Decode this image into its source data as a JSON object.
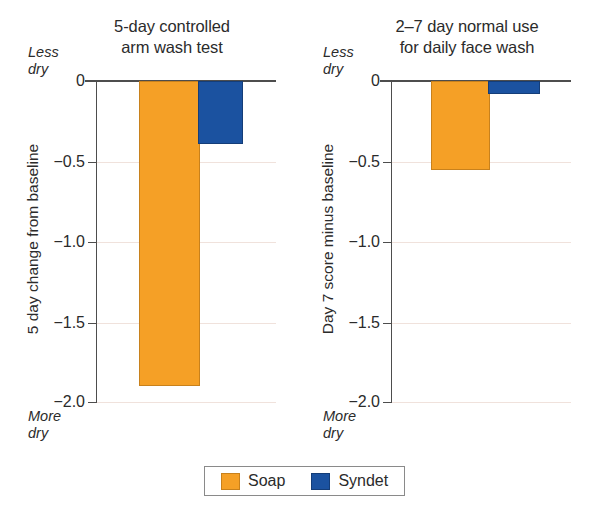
{
  "chart_data": [
    {
      "type": "bar",
      "title": "5-day controlled arm wash test",
      "title_lines": [
        "5-day controlled",
        "arm wash test"
      ],
      "xlabel": "",
      "ylabel": "5 day change from baseline",
      "ylim": [
        -2.0,
        0
      ],
      "yticks": [
        0,
        -0.5,
        -1.0,
        -1.5,
        -2.0
      ],
      "ytick_labels": [
        "0",
        "−0.5",
        "−1.0",
        "−1.5",
        "−2.0"
      ],
      "grid": true,
      "categories": [
        ""
      ],
      "series": [
        {
          "name": "Soap",
          "values": [
            -1.88
          ],
          "color": "#f5a026"
        },
        {
          "name": "Syndet",
          "values": [
            -0.38
          ],
          "color": "#1b52a0"
        }
      ],
      "annotations": {
        "axis_top": "Less dry",
        "axis_top_lines": [
          "Less",
          "dry"
        ],
        "axis_bottom": "More dry",
        "axis_bottom_lines": [
          "More",
          "dry"
        ]
      }
    },
    {
      "type": "bar",
      "title": "2–7 day normal use for daily face wash",
      "title_lines": [
        "2–7 day normal use",
        "for daily face wash"
      ],
      "xlabel": "",
      "ylabel": "Day 7 score minus baseline",
      "ylim": [
        -2.0,
        0
      ],
      "yticks": [
        0,
        -0.5,
        -1.0,
        -1.5,
        -2.0
      ],
      "ytick_labels": [
        "0",
        "−0.5",
        "−1.0",
        "−1.5",
        "−2.0"
      ],
      "grid": true,
      "categories": [
        ""
      ],
      "series": [
        {
          "name": "Soap",
          "values": [
            -0.54
          ],
          "color": "#f5a026"
        },
        {
          "name": "Syndet",
          "values": [
            -0.07
          ],
          "color": "#1b52a0"
        }
      ],
      "annotations": {
        "axis_top": "Less dry",
        "axis_top_lines": [
          "Less",
          "dry"
        ],
        "axis_bottom": "More dry",
        "axis_bottom_lines": [
          "More",
          "dry"
        ]
      }
    }
  ],
  "legend": {
    "position": "bottom-center",
    "entries": [
      {
        "label": "Soap",
        "color": "#f5a026"
      },
      {
        "label": "Syndet",
        "color": "#1b52a0"
      }
    ]
  },
  "colors": {
    "soap": "#f5a026",
    "syndet": "#1b52a0",
    "axis": "#4d4d4d",
    "gridline": "#f0e2dc",
    "text": "#2b2b2b"
  }
}
